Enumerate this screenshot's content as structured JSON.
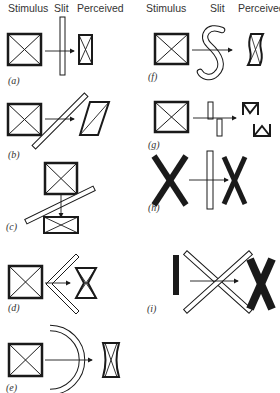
{
  "headers": {
    "left": {
      "stimulus": "Stimulus",
      "slit": "Slit",
      "perceived": "Perceived"
    },
    "right": {
      "stimulus": "Stimulus",
      "slit": "Slit",
      "perceived": "Perceived"
    }
  },
  "panels": [
    {
      "id": "a",
      "label": "(a)",
      "slit": "vertical straight slit",
      "perceived": "horizontally compressed box with X"
    },
    {
      "id": "b",
      "label": "(b)",
      "slit": "diagonal slit",
      "perceived": "sheared parallelogram with diagonal"
    },
    {
      "id": "c",
      "label": "(c)",
      "slit": "shallow diagonal slit, vertical motion",
      "perceived": "vertically compressed box with X"
    },
    {
      "id": "d",
      "label": "(d)",
      "slit": "chevron (<) slit",
      "perceived": "chevron-indented box"
    },
    {
      "id": "e",
      "label": "(e)",
      "slit": "curved arc slit",
      "perceived": "concave-sided box"
    },
    {
      "id": "f",
      "label": "(f)",
      "slit": "S-shaped slit",
      "perceived": "wavy box"
    },
    {
      "id": "g",
      "label": "(g)",
      "slit": "split offset slit",
      "perceived": "fragmented M / W shapes"
    },
    {
      "id": "h",
      "label": "(h)",
      "slit": "vertical straight slit",
      "perceived": "narrow X"
    },
    {
      "id": "i",
      "label": "(i)",
      "slit": "X-shaped slit",
      "perceived": "X from vertical bar"
    }
  ],
  "colors": {
    "ink": "#1a1a1a",
    "background": "#ffffff"
  }
}
